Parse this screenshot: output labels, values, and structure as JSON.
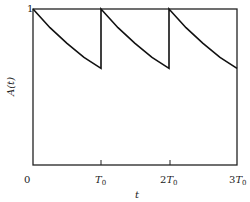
{
  "chart_data": {
    "type": "line",
    "title": "",
    "xlabel": "t",
    "ylabel": "A(t)",
    "x_ticks": [
      "0",
      "T0",
      "2T0",
      "3T0"
    ],
    "y_ticks": [
      "1"
    ],
    "xlim": [
      0,
      3
    ],
    "ylim": [
      0,
      1
    ],
    "grid": false,
    "legend": null,
    "series": [
      {
        "name": "A(t)",
        "x": [
          0,
          0.25,
          0.5,
          0.75,
          1.0,
          1.0,
          1.25,
          1.5,
          1.75,
          2.0,
          2.0,
          2.25,
          2.5,
          2.75,
          3.0
        ],
        "y": [
          1.0,
          0.88,
          0.78,
          0.69,
          0.62,
          1.0,
          0.88,
          0.78,
          0.69,
          0.62,
          1.0,
          0.88,
          0.78,
          0.69,
          0.62
        ]
      }
    ]
  },
  "labels": {
    "y_top": "1",
    "x_zero": "0",
    "x_t0": "T",
    "x_2t0_coef": "2",
    "x_3t0_coef": "3",
    "x_sub": "0",
    "xlabel": "t",
    "ylabel": "A(t)"
  }
}
